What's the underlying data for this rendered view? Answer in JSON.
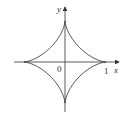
{
  "diagram": {
    "type": "astroid",
    "equation": "x^(2/3) + y^(2/3) = 1",
    "labels": {
      "x_axis": "x",
      "y_axis": "y",
      "origin": "0",
      "x_tick": "1"
    },
    "colors": {
      "stroke": "#333333",
      "background": "#ffffff"
    }
  }
}
